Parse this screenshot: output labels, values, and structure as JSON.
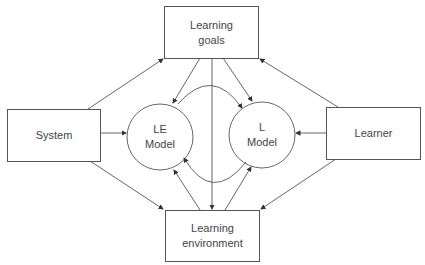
{
  "nodes": {
    "learning_goals": {
      "line1": "Learning",
      "line2": "goals"
    },
    "system": {
      "label": "System"
    },
    "learner": {
      "label": "Learner"
    },
    "learning_environment": {
      "line1": "Learning",
      "line2": "environment"
    },
    "le_model": {
      "line1": "LE",
      "line2": "Model"
    },
    "l_model": {
      "line1": "L",
      "line2": "Model"
    }
  },
  "colors": {
    "stroke": "#555555",
    "text": "#444444",
    "background": "#ffffff"
  }
}
